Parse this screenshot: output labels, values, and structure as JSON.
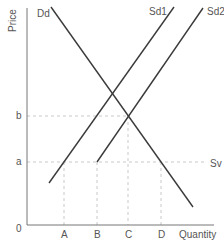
{
  "diagram": {
    "type": "supply-demand",
    "axes": {
      "y_label": "Price",
      "x_label": "Quantity",
      "origin_label": "0",
      "y_ticks": [
        {
          "label": "b",
          "y": 116
        },
        {
          "label": "a",
          "y": 162
        }
      ],
      "x_ticks": [
        {
          "label": "A",
          "x": 64
        },
        {
          "label": "B",
          "x": 97
        },
        {
          "label": "C",
          "x": 128
        },
        {
          "label": "D",
          "x": 161
        }
      ]
    },
    "curves": [
      {
        "name": "Dd",
        "label": "Dd",
        "x1": 51,
        "y1": 7,
        "x2": 193,
        "y2": 207
      },
      {
        "name": "Sd1",
        "label": "Sd1",
        "x1": 49,
        "y1": 183,
        "x2": 174,
        "y2": 7
      },
      {
        "name": "Sd2",
        "label": "Sd2",
        "x1": 97,
        "y1": 162,
        "x2": 203,
        "y2": 8
      }
    ],
    "world_supply": {
      "label": "Sv",
      "y": 162
    },
    "colors": {
      "curve": "#3a3a3a",
      "axis": "#777777",
      "guide": "#bbbbbb",
      "text": "#555555"
    }
  }
}
